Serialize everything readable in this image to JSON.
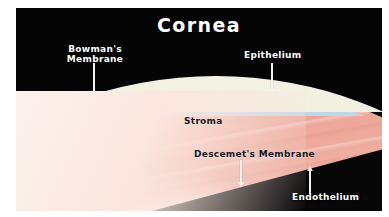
{
  "figure": {
    "title": "Cornea",
    "background_color": "#050505",
    "page_color": "#ffffff"
  },
  "labels": {
    "bowman": "Bowman's\nMembrane",
    "bowman_line1": "Bowman's",
    "bowman_line2": "Membrane",
    "epithelium": "Epithelium",
    "stroma": "Stroma",
    "descemet": "Descemet's Membrane",
    "endothelium": "Endothelium"
  },
  "layers": [
    {
      "name": "epithelium",
      "label": "Epithelium",
      "color": "#e7e8d6",
      "position": "outermost"
    },
    {
      "name": "bowman-membrane",
      "label": "Bowman's Membrane",
      "color": "#bcd6e8",
      "position": "beneath-epithelium"
    },
    {
      "name": "stroma",
      "label": "Stroma",
      "color": "#f0b4a6",
      "position": "middle-bulk"
    },
    {
      "name": "descemet-membrane",
      "label": "Descemet's Membrane",
      "color": "#efe6d4",
      "position": "inner-thin-line"
    },
    {
      "name": "endothelium",
      "label": "Endothelium",
      "color": "#ffffff",
      "position": "innermost"
    }
  ],
  "annotations": [
    {
      "name": "bowman",
      "direction": "down",
      "color": "#f2f2f2"
    },
    {
      "name": "epithelium",
      "direction": "down",
      "color": "#f2f2f2"
    },
    {
      "name": "descemet",
      "direction": "down",
      "color": "#f2f2f2"
    },
    {
      "name": "endothelium",
      "direction": "up",
      "color": "#f2f2f2"
    }
  ],
  "colors": {
    "title_text": "#ffffff",
    "light_label_text": "#ffffff",
    "dark_label_text": "#16161c",
    "plate_background": "#050505",
    "stroma_pink": "#f0b4a6",
    "bowman_blue": "#bcd6e8",
    "epithelium_cream": "#e7e8d6"
  }
}
